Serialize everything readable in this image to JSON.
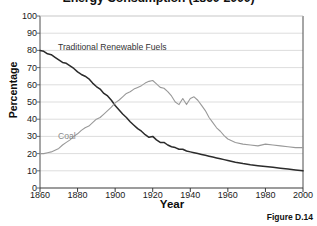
{
  "chart_data": {
    "type": "line",
    "title": "Energy Consumption (1860-2000)",
    "xlabel": "Year",
    "ylabel": "Percentage",
    "xlim": [
      1860,
      2000
    ],
    "ylim": [
      0,
      100
    ],
    "xticks": [
      1860,
      1880,
      1900,
      1920,
      1940,
      1960,
      1980,
      2000
    ],
    "yticks": [
      0,
      10,
      20,
      30,
      40,
      50,
      60,
      70,
      80,
      90,
      100
    ],
    "grid": "horizontal",
    "legend": "inline-labels",
    "caption": "Figure D.14",
    "series": [
      {
        "name": "Traditional Renewable Fuels",
        "color": "#2b2b2b",
        "label_position": {
          "x": 1869,
          "y": 73
        },
        "x": [
          1860,
          1862,
          1864,
          1866,
          1868,
          1870,
          1872,
          1874,
          1876,
          1878,
          1880,
          1882,
          1884,
          1886,
          1888,
          1890,
          1892,
          1894,
          1896,
          1898,
          1900,
          1902,
          1904,
          1906,
          1908,
          1910,
          1912,
          1914,
          1916,
          1918,
          1920,
          1922,
          1924,
          1926,
          1928,
          1930,
          1932,
          1934,
          1936,
          1938,
          1940,
          1942,
          1944,
          1946,
          1948,
          1950,
          1952,
          1954,
          1956,
          1958,
          1960,
          1964,
          1968,
          1972,
          1976,
          1980,
          1984,
          1988,
          1992,
          1996,
          2000
        ],
        "y": [
          80,
          79.5,
          78,
          77.5,
          76,
          74.5,
          73,
          72.5,
          71,
          69.5,
          67.5,
          66,
          65,
          63.5,
          61,
          59,
          57.5,
          55,
          53.5,
          51,
          48,
          45.5,
          43,
          41,
          38.5,
          36.5,
          34.5,
          33,
          31,
          29.5,
          30,
          28,
          26.5,
          26.5,
          25,
          24,
          23.5,
          22.5,
          22.5,
          21.5,
          21,
          20.5,
          20,
          19.5,
          19,
          18.5,
          18,
          17.5,
          17,
          16.5,
          16,
          15,
          14.2,
          13.5,
          13,
          12.5,
          12,
          11.5,
          11,
          10.5,
          10
        ]
      },
      {
        "name": "Coal",
        "color": "#999999",
        "label_position": {
          "x": 1869,
          "y": 22
        },
        "x": [
          1860,
          1862,
          1864,
          1866,
          1868,
          1870,
          1872,
          1874,
          1876,
          1878,
          1880,
          1882,
          1884,
          1886,
          1888,
          1890,
          1892,
          1894,
          1896,
          1898,
          1900,
          1902,
          1904,
          1906,
          1908,
          1910,
          1912,
          1914,
          1916,
          1918,
          1920,
          1922,
          1924,
          1926,
          1928,
          1930,
          1932,
          1934,
          1936,
          1938,
          1940,
          1942,
          1944,
          1946,
          1948,
          1950,
          1952,
          1954,
          1956,
          1958,
          1960,
          1964,
          1968,
          1972,
          1976,
          1980,
          1984,
          1988,
          1992,
          1996,
          2000
        ],
        "y": [
          20,
          20,
          20.5,
          21,
          22,
          23,
          25,
          26.5,
          28,
          30,
          31.5,
          33.5,
          35,
          36,
          38,
          40,
          41,
          43,
          45,
          47,
          49.5,
          51,
          53,
          55,
          56,
          57.5,
          58.5,
          59.5,
          61,
          62,
          62.5,
          60.5,
          58.5,
          58,
          56,
          53.5,
          50,
          48.5,
          52,
          48.5,
          52,
          53,
          51,
          48,
          45,
          41,
          38,
          35,
          33,
          30.5,
          28.5,
          26.5,
          25.5,
          25,
          24.5,
          25.5,
          25,
          24.5,
          24,
          23.5,
          23.5
        ]
      }
    ]
  }
}
